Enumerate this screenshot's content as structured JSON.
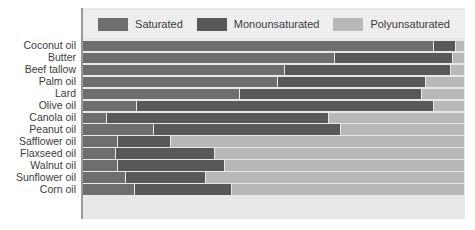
{
  "chart_data": {
    "type": "bar",
    "orientation": "horizontal",
    "stacked": true,
    "normalized": true,
    "title": "",
    "xlabel": "",
    "ylabel": "",
    "xlim": [
      0,
      100
    ],
    "grid": false,
    "legend_position": "top",
    "categories": [
      "Coconut oil",
      "Butter",
      "Beef tallow",
      "Palm oil",
      "Lard",
      "Olive oil",
      "Canola oil",
      "Peanut oil",
      "Safflower oil",
      "Flaxseed oil",
      "Walnut oil",
      "Sunflower oil",
      "Corn oil"
    ],
    "series": [
      {
        "name": "Saturated",
        "color": "#6e6e6e",
        "values": [
          92,
          66,
          53,
          51,
          41,
          14,
          6,
          18.5,
          9,
          8.5,
          9,
          11,
          13.5
        ]
      },
      {
        "name": "Monounsaturated",
        "color": "#585858",
        "values": [
          6,
          31,
          43.5,
          39,
          48,
          78,
          58.5,
          49,
          14,
          26,
          28,
          21,
          25.5
        ]
      },
      {
        "name": "Polyunsaturated",
        "color": "#b8b8b8",
        "values": [
          2,
          3,
          3.5,
          10,
          11,
          8,
          35.5,
          32.5,
          77,
          65.5,
          63,
          68,
          61
        ]
      }
    ]
  },
  "legend": {
    "entries": [
      {
        "label": "Saturated",
        "color": "#6e6e6e"
      },
      {
        "label": "Monounsaturated",
        "color": "#585858"
      },
      {
        "label": "Polyunsaturated",
        "color": "#b8b8b8"
      }
    ]
  },
  "colors": {
    "panel_background": "#e8e8e8",
    "legend_background": "#eeeeee",
    "axis_line": "#9a9a9a",
    "label_text": "#3c3c3c",
    "track": "#c3c3c3"
  }
}
